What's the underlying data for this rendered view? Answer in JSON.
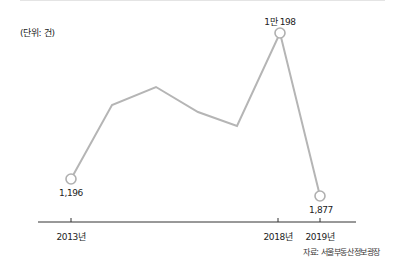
{
  "chart_data": {
    "type": "line",
    "title": "",
    "unit_label": "(단위: 건)",
    "xlabel": "",
    "ylabel": "",
    "x": [
      "2013년",
      "",
      "",
      "",
      "",
      "2018년",
      "2019년"
    ],
    "tick_labels": [
      "2013년",
      "2018년",
      "2019년"
    ],
    "series": [
      {
        "name": "거래 건수",
        "values": [
          1196,
          5760,
          6870,
          5330,
          4460,
          10198,
          1877
        ],
        "data_labels": [
          "1,196",
          null,
          null,
          null,
          null,
          "1만 198",
          "1,877"
        ]
      }
    ],
    "points_px": [
      [
        71,
        179
      ],
      [
        112,
        105
      ],
      [
        156,
        87
      ],
      [
        198,
        112
      ],
      [
        237,
        126
      ],
      [
        280,
        33
      ],
      [
        320,
        196
      ]
    ],
    "annotations": [
      "1,196",
      "1만 198",
      "1,877"
    ],
    "source": "자료: 서울부동산정보광장",
    "grid": false,
    "legend": "none",
    "line_color": "#b5b5b5",
    "axis_color": "#333333"
  },
  "labels": {
    "unit": "(단위: 건)",
    "v2013": "1,196",
    "v2018": "1만 198",
    "v2019": "1,877",
    "x2013": "2013년",
    "x2018": "2018년",
    "x2019": "2019년",
    "source": "자료: 서울부동산정보광장"
  }
}
